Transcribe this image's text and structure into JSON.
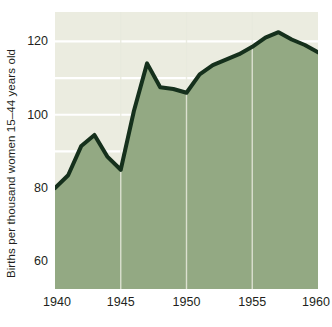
{
  "chart_data": {
    "type": "area",
    "title": "",
    "subtitle": "",
    "xlabel": "",
    "ylabel": "Births per thousand women 15–44 years old",
    "x": [
      1940,
      1941,
      1942,
      1943,
      1944,
      1945,
      1946,
      1947,
      1948,
      1949,
      1950,
      1951,
      1952,
      1953,
      1954,
      1955,
      1956,
      1957,
      1958,
      1959,
      1960
    ],
    "values": [
      80,
      83.5,
      91.5,
      94.5,
      88.5,
      85,
      101,
      114,
      107.5,
      107,
      106,
      111,
      113.5,
      115,
      116.5,
      118.5,
      121,
      122.5,
      120.5,
      119,
      117
    ],
    "series": [
      {
        "name": "Births per thousand women 15–44 years old",
        "values": [
          80,
          83.5,
          91.5,
          94.5,
          88.5,
          85,
          101,
          114,
          107.5,
          107,
          106,
          111,
          113.5,
          115,
          116.5,
          118.5,
          121,
          122.5,
          120.5,
          119,
          117
        ]
      }
    ],
    "xlim": [
      1940,
      1960
    ],
    "ylim": [
      52.5,
      128
    ],
    "x_ticks": [
      1940,
      1945,
      1950,
      1955,
      1960
    ],
    "x_tick_labels": [
      "1940",
      "1945",
      "1950",
      "1955",
      "1960"
    ],
    "y_ticks": [
      60,
      80,
      100,
      120
    ],
    "y_tick_labels": [
      "60",
      "80",
      "100",
      "120"
    ],
    "gridlines": {
      "horizontal": [
        60,
        70,
        80,
        90,
        100,
        110,
        120
      ],
      "horizontal_visible_above_area": true,
      "vertical": [
        1945,
        1950,
        1955
      ]
    },
    "legend": {
      "visible": false,
      "position": "none",
      "entries": []
    },
    "annotations": [],
    "colors": {
      "area_fill": "#93a983",
      "line": "#15301c",
      "plot_background": "#ebece0",
      "gridline": "#ffffff",
      "vertical_gridline": "#e8eade",
      "text": "#231f20",
      "page_background": "#ffffff"
    }
  },
  "axis": {
    "y_title": "Births per thousand women 15–44 years old"
  }
}
